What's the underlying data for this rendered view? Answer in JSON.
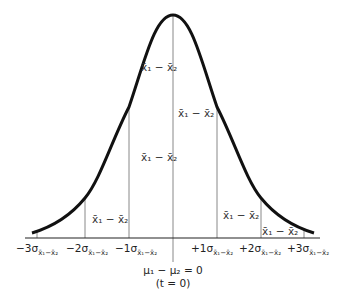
{
  "diagram": {
    "type": "normal-distribution-sampling-distribution-of-difference-of-means",
    "curve_color": "#111111",
    "line_color": "#888888",
    "axis_color": "#222222",
    "region_label": "x̄1 − x̄2",
    "region_labels": [
      {
        "id": "center-left-upper",
        "text": "x̄₁ − x̄₂"
      },
      {
        "id": "center-right-mid",
        "text": "x̄₁ − x̄₂"
      },
      {
        "id": "center-left-mid",
        "text": "x̄₁ − x̄₂"
      },
      {
        "id": "left-tail",
        "text": "x̄₁ − x̄₂"
      },
      {
        "id": "right-mid",
        "text": "x̄₁ − x̄₂"
      },
      {
        "id": "right-tail",
        "text": "x̄₁ − x̄₂"
      }
    ],
    "ticks": [
      {
        "prefix": "−3σ",
        "sub": "x̄₁−x̄₂"
      },
      {
        "prefix": "−2σ",
        "sub": "x̄₁−x̄₂"
      },
      {
        "prefix": "−1σ",
        "sub": "x̄₁−x̄₂"
      },
      {
        "prefix": "+1σ",
        "sub": "x̄₁−x̄₂"
      },
      {
        "prefix": "+2σ",
        "sub": "x̄₁−x̄₂"
      },
      {
        "prefix": "+3σ",
        "sub": "x̄₁−x̄₂"
      }
    ],
    "center_label": {
      "line1": "μ₁ − μ₂ = 0",
      "line2": "(t = 0)"
    }
  }
}
